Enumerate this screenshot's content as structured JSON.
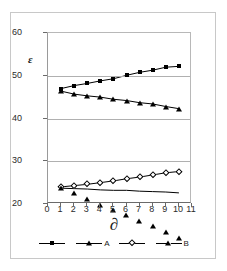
{
  "chart_data": {
    "type": "line",
    "title": "",
    "xlabel": "∂",
    "ylabel": "ε",
    "xlim": [
      0,
      11
    ],
    "ylim": [
      20,
      60
    ],
    "grid": true,
    "legend_position": "bottom",
    "x": [
      1,
      2,
      3,
      4,
      5,
      6,
      7,
      8,
      9,
      10
    ],
    "xticks": [
      "0",
      "1",
      "2",
      "3",
      "4",
      "5",
      "6",
      "7",
      "8",
      "9",
      "10",
      "11"
    ],
    "yticks": [
      "20",
      "30",
      "40",
      "50",
      "60"
    ],
    "gridlines": [
      30,
      40,
      50
    ],
    "series": [
      {
        "name": "",
        "marker": "filled-square",
        "values": [
          47.0,
          47.7,
          48.2,
          48.8,
          49.3,
          50.1,
          50.8,
          51.3,
          52.0,
          52.2
        ]
      },
      {
        "name": "A",
        "marker": "filled-triangle",
        "values": [
          46.4,
          45.7,
          45.3,
          45.0,
          44.5,
          44.2,
          43.7,
          43.4,
          42.8,
          42.3
        ]
      },
      {
        "name": "",
        "marker": "open-diamond",
        "values": [
          24.0,
          24.3,
          24.6,
          25.0,
          25.4,
          25.9,
          26.3,
          26.8,
          27.3,
          27.6
        ]
      },
      {
        "name": "B",
        "marker": "open-triangle",
        "values": [
          23.7,
          23.6,
          23.5,
          23.3,
          23.2,
          23.2,
          23.0,
          22.9,
          22.8,
          22.6
        ]
      }
    ]
  },
  "legend": {
    "entries": [
      {
        "label": "",
        "marker": "filled-square"
      },
      {
        "label": "A",
        "marker": "filled-triangle"
      },
      {
        "label": "",
        "marker": "open-diamond"
      },
      {
        "label": "B",
        "marker": "open-triangle"
      }
    ]
  },
  "axes": {
    "y_title": "ε",
    "x_title": "∂"
  }
}
